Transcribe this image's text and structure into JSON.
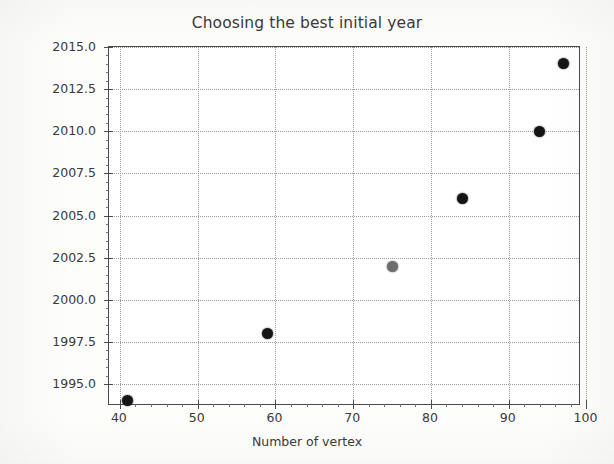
{
  "chart_data": {
    "type": "scatter",
    "title": "Choosing the best initial year",
    "xlabel": "Number of vertex",
    "ylabel": "Initial Year",
    "xlim": [
      38.6,
      99.3
    ],
    "ylim": [
      1993.7,
      2015.0
    ],
    "grid": true,
    "legend": false,
    "marker_color": "#151515",
    "xticks": [
      40,
      50,
      60,
      70,
      80,
      90,
      100
    ],
    "xtick_labels": [
      "40",
      "50",
      "60",
      "70",
      "80",
      "90",
      "100"
    ],
    "yticks": [
      1995.0,
      1997.5,
      2000.0,
      2002.5,
      2005.0,
      2007.5,
      2010.0,
      2012.5,
      2015.0
    ],
    "ytick_labels": [
      "1995.0",
      "1997.5",
      "2000.0",
      "2002.5",
      "2005.0",
      "2007.5",
      "2010.0",
      "2012.5",
      "2015.0"
    ],
    "x": [
      41,
      59,
      75,
      84,
      94,
      97
    ],
    "y": [
      1994,
      1998,
      2002,
      2006,
      2010,
      2014
    ],
    "points": [
      {
        "x": 41,
        "y": 1994,
        "faded": false
      },
      {
        "x": 59,
        "y": 1998,
        "faded": false
      },
      {
        "x": 75,
        "y": 2002,
        "faded": true
      },
      {
        "x": 84,
        "y": 2006,
        "faded": false
      },
      {
        "x": 94,
        "y": 2010,
        "faded": false
      },
      {
        "x": 97,
        "y": 2014,
        "faded": false
      }
    ]
  }
}
